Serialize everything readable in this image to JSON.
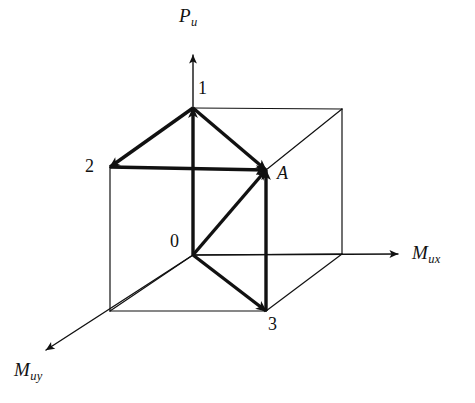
{
  "figure": {
    "background_color": "#ffffff",
    "stroke_color": "#111111",
    "canvas": {
      "width": 475,
      "height": 403
    }
  },
  "axes": [
    {
      "key": "pu",
      "name": "axial-load-axis",
      "symbol": "P",
      "subscript": "u",
      "direction": "up",
      "origin": {
        "x": 193,
        "y": 255
      },
      "tip": {
        "x": 193,
        "y": 55
      },
      "label_pos": {
        "x": 179,
        "y": 6
      }
    },
    {
      "key": "mux",
      "name": "moment-x-axis",
      "symbol": "M",
      "subscript": "ux",
      "direction": "right",
      "origin": {
        "x": 193,
        "y": 255
      },
      "tip": {
        "x": 398,
        "y": 254
      },
      "label_pos": {
        "x": 412,
        "y": 243
      }
    },
    {
      "key": "muy",
      "name": "moment-y-axis",
      "symbol": "M",
      "subscript": "uy",
      "direction": "down-left",
      "origin": {
        "x": 193,
        "y": 255
      },
      "tip": {
        "x": 46,
        "y": 350
      },
      "label_pos": {
        "x": 14,
        "y": 360
      }
    }
  ],
  "points": [
    {
      "key": "o",
      "label": "0",
      "name": "origin-point",
      "x": 193,
      "y": 255,
      "label_pos": {
        "x": 170,
        "y": 232
      }
    },
    {
      "key": "p1",
      "label": "1",
      "name": "vertex-1",
      "x": 193,
      "y": 108,
      "label_pos": {
        "x": 198,
        "y": 79
      }
    },
    {
      "key": "p2",
      "label": "2",
      "name": "vertex-2",
      "x": 110,
      "y": 167,
      "label_pos": {
        "x": 85,
        "y": 157
      }
    },
    {
      "key": "p3",
      "label": "3",
      "name": "vertex-3",
      "x": 266,
      "y": 311,
      "label_pos": {
        "x": 268,
        "y": 315
      }
    },
    {
      "key": "pa",
      "label": "A",
      "name": "point-a",
      "x": 266,
      "y": 170,
      "label_pos": {
        "x": 277,
        "y": 164
      }
    }
  ],
  "cube": {
    "name": "interaction-surface-box",
    "stroke_width": 1.2,
    "edges": [
      {
        "name": "edge-front-top",
        "from": {
          "x": 110,
          "y": 167
        },
        "to": {
          "x": 266,
          "y": 170
        }
      },
      {
        "name": "edge-front-left",
        "from": {
          "x": 110,
          "y": 167
        },
        "to": {
          "x": 110,
          "y": 311
        }
      },
      {
        "name": "edge-front-right",
        "from": {
          "x": 266,
          "y": 170
        },
        "to": {
          "x": 266,
          "y": 311
        }
      },
      {
        "name": "edge-front-bottom",
        "from": {
          "x": 110,
          "y": 311
        },
        "to": {
          "x": 266,
          "y": 311
        }
      },
      {
        "name": "edge-back-top",
        "from": {
          "x": 193,
          "y": 108
        },
        "to": {
          "x": 342,
          "y": 109
        }
      },
      {
        "name": "edge-back-right-vertical",
        "from": {
          "x": 342,
          "y": 109
        },
        "to": {
          "x": 342,
          "y": 254
        }
      },
      {
        "name": "edge-back-bottom",
        "from": {
          "x": 193,
          "y": 255
        },
        "to": {
          "x": 342,
          "y": 254
        }
      },
      {
        "name": "edge-back-left-vertical",
        "from": {
          "x": 193,
          "y": 108
        },
        "to": {
          "x": 193,
          "y": 255
        }
      },
      {
        "name": "edge-diagonal-top-left",
        "from": {
          "x": 110,
          "y": 167
        },
        "to": {
          "x": 193,
          "y": 108
        }
      },
      {
        "name": "edge-diagonal-top-right",
        "from": {
          "x": 266,
          "y": 170
        },
        "to": {
          "x": 342,
          "y": 109
        }
      },
      {
        "name": "edge-diagonal-bottom-left",
        "from": {
          "x": 110,
          "y": 311
        },
        "to": {
          "x": 193,
          "y": 255
        }
      },
      {
        "name": "edge-diagonal-bottom-right",
        "from": {
          "x": 266,
          "y": 311
        },
        "to": {
          "x": 342,
          "y": 254
        }
      }
    ]
  },
  "vectors": [
    {
      "name": "vector-1-to-2",
      "from_point": "1",
      "to_point": "2",
      "from": {
        "x": 193,
        "y": 108
      },
      "to": {
        "x": 110,
        "y": 167
      }
    },
    {
      "name": "vector-1-to-a",
      "from_point": "1",
      "to_point": "A",
      "from": {
        "x": 193,
        "y": 108
      },
      "to": {
        "x": 266,
        "y": 170
      }
    },
    {
      "name": "vector-o-to-1",
      "from_point": "0",
      "to_point": "1",
      "from": {
        "x": 193,
        "y": 255
      },
      "to": {
        "x": 193,
        "y": 108
      }
    },
    {
      "name": "vector-2-to-a",
      "from_point": "2",
      "to_point": "A",
      "from": {
        "x": 110,
        "y": 167
      },
      "to": {
        "x": 266,
        "y": 170
      }
    },
    {
      "name": "vector-o-to-a",
      "from_point": "0",
      "to_point": "A",
      "from": {
        "x": 193,
        "y": 255
      },
      "to": {
        "x": 266,
        "y": 170
      }
    },
    {
      "name": "vector-o-to-3",
      "from_point": "0",
      "to_point": "3",
      "from": {
        "x": 193,
        "y": 255
      },
      "to": {
        "x": 266,
        "y": 311
      }
    },
    {
      "name": "vector-3-to-a",
      "from_point": "3",
      "to_point": "A",
      "from": {
        "x": 266,
        "y": 311
      },
      "to": {
        "x": 266,
        "y": 170
      }
    }
  ],
  "styles": {
    "vector_stroke_width": 3.4,
    "axis_stroke_width": 1.4
  }
}
